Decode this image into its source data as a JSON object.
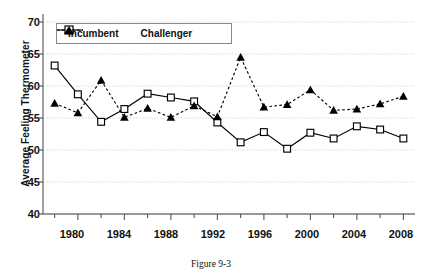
{
  "caption": "Figure 9-3",
  "legend": {
    "position": "top-left-inside",
    "items": [
      {
        "label": "Incumbent",
        "marker": "open-square",
        "line": "solid"
      },
      {
        "label": "Challenger",
        "marker": "filled-triangle",
        "line": "dashed"
      }
    ]
  },
  "axes": {
    "y_label": "Average Feeling Thermometer",
    "y_ticks": [
      70,
      65,
      60,
      55,
      50,
      45,
      40
    ],
    "x_ticks": [
      1980,
      1984,
      1988,
      1992,
      1996,
      2000,
      2004,
      2008
    ]
  },
  "chart_data": {
    "type": "line",
    "title": "",
    "xlabel": "",
    "ylabel": "Average Feeling Thermometer",
    "xlim": [
      1977,
      2009
    ],
    "ylim": [
      40,
      70
    ],
    "grid": true,
    "legend_position": "upper-left",
    "x": [
      1978,
      1980,
      1982,
      1984,
      1986,
      1988,
      1990,
      1992,
      1994,
      1996,
      1998,
      2000,
      2002,
      2004,
      2006,
      2008
    ],
    "series": [
      {
        "name": "Incumbent",
        "marker": "open-square",
        "line": "solid",
        "values": [
          63.2,
          58.7,
          54.4,
          56.4,
          58.8,
          58.2,
          57.6,
          54.3,
          51.2,
          52.8,
          50.2,
          52.7,
          51.8,
          53.7,
          53.2,
          51.8
        ]
      },
      {
        "name": "Challenger",
        "marker": "filled-triangle",
        "line": "dashed",
        "values": [
          57.3,
          55.8,
          60.9,
          55.1,
          56.5,
          55.1,
          56.9,
          55.2,
          64.5,
          56.7,
          57.1,
          59.4,
          56.2,
          56.4,
          57.2,
          58.4
        ]
      }
    ]
  }
}
